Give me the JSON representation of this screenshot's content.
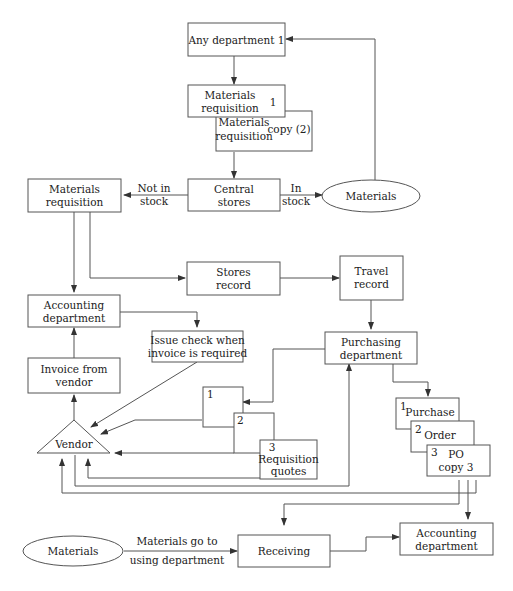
{
  "diagram": {
    "type": "flowchart",
    "title": "",
    "nodes": {
      "any_dept": {
        "lines": [
          "Any department 1"
        ]
      },
      "mat_req_1": {
        "lines": [
          "Materials",
          "requisition"
        ],
        "number": "1"
      },
      "mat_req_copy": {
        "lines": [
          "Materials",
          "requisition"
        ],
        "note": "copy (2)"
      },
      "central_stores": {
        "lines": [
          "Central",
          "stores"
        ]
      },
      "materials_top": {
        "lines": [
          "Materials"
        ]
      },
      "mat_req_left": {
        "lines": [
          "Materials",
          "requisition"
        ]
      },
      "stores_record": {
        "lines": [
          "Stores",
          "record"
        ]
      },
      "travel_record": {
        "lines": [
          "Travel",
          "record"
        ]
      },
      "accounting_top": {
        "lines": [
          "Accounting",
          "department"
        ]
      },
      "issue_check": {
        "lines": [
          "Issue check when",
          "invoice is required"
        ]
      },
      "purchasing": {
        "lines": [
          "Purchasing",
          "department"
        ]
      },
      "invoice": {
        "lines": [
          "Invoice from",
          "vendor"
        ]
      },
      "req_q1": {
        "number": "1"
      },
      "req_q2": {
        "number": "2"
      },
      "req_q3": {
        "number": "3",
        "lines": [
          "Requisition",
          "quotes"
        ]
      },
      "po1": {
        "number": "1",
        "lines": [
          "Purchase"
        ]
      },
      "po2": {
        "number": "2",
        "lines": [
          "Order"
        ]
      },
      "po3": {
        "number": "3",
        "lines": [
          "PO",
          "copy 3"
        ]
      },
      "vendor": {
        "lines": [
          "Vendor"
        ]
      },
      "materials_bottom": {
        "lines": [
          "Materials"
        ]
      },
      "receiving": {
        "lines": [
          "Receiving"
        ]
      },
      "accounting_bottom": {
        "lines": [
          "Accounting",
          "department"
        ]
      }
    },
    "edge_labels": {
      "not_in_stock": [
        "Not in",
        "stock"
      ],
      "in_stock": [
        "In",
        "stock"
      ],
      "materials_go": [
        "Materials go to",
        "using department"
      ]
    },
    "colors": {
      "line": "#555555",
      "text": "#222222",
      "background": "#ffffff"
    }
  }
}
